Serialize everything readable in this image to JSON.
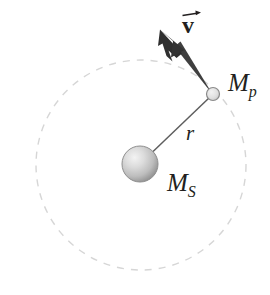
{
  "figure": {
    "background_color": "#ffffff",
    "width": 270,
    "height": 295
  },
  "labels": {
    "velocity": {
      "symbol": "v",
      "accent": "vector-arrow",
      "style": "bold"
    },
    "planet_mass": {
      "symbol": "M",
      "subscript": "p"
    },
    "star_mass": {
      "symbol": "M",
      "subscript": "S"
    },
    "radius": {
      "symbol": "r"
    }
  },
  "colors": {
    "orbit_dash": "#d8d8d8",
    "radius_line": "#5a5a5a",
    "arrow": "#3d3d3d",
    "star_fill_light": "#efefef",
    "star_fill_dark": "#8e8e8e",
    "star_stroke": "#8a8a8a",
    "planet_fill": "#e2e2e2",
    "planet_stroke": "#8a8a8a",
    "text": "#231f20"
  },
  "geometry": {
    "orbit": {
      "cx": 141,
      "cy": 165,
      "r": 105,
      "dash": "7 7"
    },
    "star": {
      "cx": 140,
      "cy": 164,
      "r": 18
    },
    "planet": {
      "cx": 213,
      "cy": 94,
      "r": 6.5
    },
    "radius_line": {
      "x1": 140,
      "y1": 164,
      "x2": 209,
      "y2": 97
    },
    "velocity_arrow": {
      "x1": 209,
      "y1": 90,
      "x2": 167,
      "y2": 38,
      "tip_x": 161,
      "tip_y": 31
    }
  }
}
